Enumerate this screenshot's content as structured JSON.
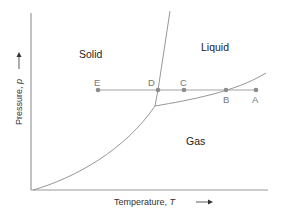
{
  "diagram": {
    "axes": {
      "x_label": "Temperature, ",
      "x_symbol": "T",
      "y_label": "Pressure, ",
      "y_symbol": "p"
    },
    "regions": {
      "solid": "Solid",
      "liquid": "Liquid",
      "gas": "Gas"
    },
    "points": [
      {
        "id": "E",
        "label": "E"
      },
      {
        "id": "D",
        "label": "D"
      },
      {
        "id": "C",
        "label": "C"
      },
      {
        "id": "B",
        "label": "B"
      },
      {
        "id": "A",
        "label": "A"
      }
    ],
    "colors": {
      "axis": "#9a9a9a",
      "curve": "#8a8a8a",
      "point": "#8c8c8c",
      "text": "#222222"
    }
  }
}
